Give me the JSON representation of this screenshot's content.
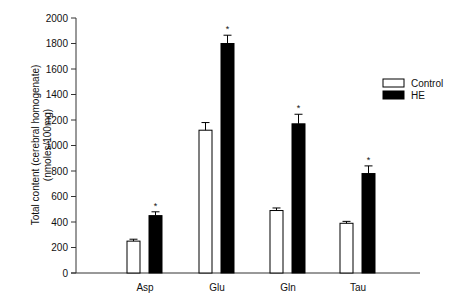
{
  "chart_data": {
    "type": "bar",
    "title": "",
    "xlabel": "",
    "ylabel": "Total content (cerebral homogenate)",
    "ylabel_line2": "(nmoles/100mg)",
    "ylim": [
      0,
      2000
    ],
    "yticks": [
      0,
      200,
      400,
      600,
      800,
      1000,
      1200,
      1400,
      1600,
      1800,
      2000
    ],
    "categories": [
      "Asp",
      "Glu",
      "Gln",
      "Tau"
    ],
    "series": [
      {
        "name": "Control",
        "color": "#ffffff",
        "values": [
          250,
          1120,
          490,
          390
        ],
        "errors": [
          15,
          60,
          20,
          15
        ],
        "significant": [
          false,
          false,
          false,
          false
        ]
      },
      {
        "name": "HE",
        "color": "#000000",
        "values": [
          450,
          1800,
          1170,
          780
        ],
        "errors": [
          30,
          65,
          75,
          60
        ],
        "significant": [
          true,
          true,
          true,
          true
        ]
      }
    ],
    "significance_marker": "*",
    "grid": false,
    "legend_position": "right"
  }
}
